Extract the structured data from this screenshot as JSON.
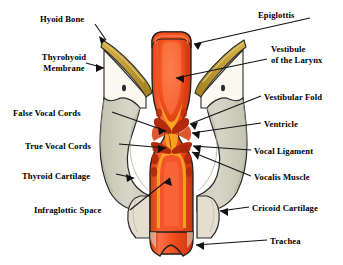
{
  "figure": {
    "labels": [
      {
        "id": "hyoid-bone",
        "text": "Hyoid Bone",
        "x": 40,
        "y": 14,
        "align": "left"
      },
      {
        "id": "epiglottis",
        "text": "Epiglottis",
        "x": 258,
        "y": 10,
        "align": "left"
      },
      {
        "id": "thyrohyoid",
        "text": "Thyrohyoid\nMembrane",
        "x": 31,
        "y": 52,
        "align": "left"
      },
      {
        "id": "vestibule",
        "text": "Vestibule\nof the Larynx",
        "x": 271,
        "y": 44,
        "align": "left"
      },
      {
        "id": "vestibular-fold",
        "text": "Vestibular Fold",
        "x": 264,
        "y": 92,
        "align": "left"
      },
      {
        "id": "false-vocal-cords",
        "text": "False Vocal Cords",
        "x": 13,
        "y": 108,
        "align": "left"
      },
      {
        "id": "ventricle",
        "text": "Ventricle",
        "x": 264,
        "y": 119,
        "align": "left"
      },
      {
        "id": "true-vocal-cords",
        "text": "True Vocal Cords",
        "x": 25,
        "y": 141,
        "align": "left"
      },
      {
        "id": "vocal-ligament",
        "text": "Vocal Ligament",
        "x": 254,
        "y": 146,
        "align": "left"
      },
      {
        "id": "thyroid-cartilage",
        "text": "Thyroid Cartilage",
        "x": 22,
        "y": 171,
        "align": "left"
      },
      {
        "id": "vocalis-muscle",
        "text": "Vocalis Muscle",
        "x": 254,
        "y": 172,
        "align": "left"
      },
      {
        "id": "infraglottic",
        "text": "Infraglottic Space",
        "x": 34,
        "y": 207,
        "align": "left"
      },
      {
        "id": "cricoid-cartilage",
        "text": "Cricoid Cartilage",
        "x": 252,
        "y": 203,
        "align": "left"
      },
      {
        "id": "trachea",
        "text": "Trachea",
        "x": 270,
        "y": 236,
        "align": "left"
      }
    ],
    "colors": {
      "background": "#ffffff",
      "hyoid_bone": "#c9a63f",
      "hyoid_bone_dark": "#a8862c",
      "thyrohyoid_membrane": "#fbf9f0",
      "thyroid_cartilage": "#cfcfc0",
      "thyroid_cartilage_shade": "#bdbdab",
      "cricoid_cartilage": "#e3ded0",
      "mucosa_orange": "#f4511e",
      "mucosa_light": "#f96a3c",
      "submucosa_yellow": "#f6a623",
      "cord_dark_red": "#b32a0c",
      "cavity_deep": "#c0300e",
      "outline": "#1a1a1a"
    }
  }
}
